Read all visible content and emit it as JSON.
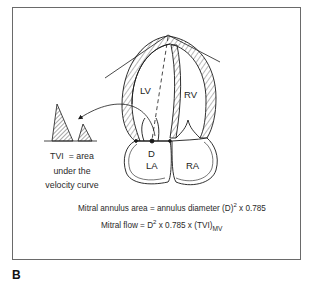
{
  "figure": {
    "panel_letter": "B",
    "chambers": {
      "lv": "LV",
      "rv": "RV",
      "la": "LA",
      "ra": "RA"
    },
    "annulus_label": "D",
    "tvi_caption": {
      "line1": "TVI  = area",
      "line2": "under the",
      "line3": "velocity curve"
    },
    "formulas": {
      "area": {
        "prefix": "Mitral annulus area = annulus diameter (D)",
        "exponent": "2",
        "suffix": " x 0.785"
      },
      "flow": {
        "prefix": "Mitral flow = D",
        "exponent": "2",
        "middle": " x 0.785 x (TVI)",
        "subscript": "MV"
      }
    },
    "icons": {
      "velocity_curve": "hatched-doppler-waveform-icon",
      "arrow": "curved-arrow-icon",
      "heart": "apical-four-chamber-heart-icon"
    },
    "colors": {
      "line": "#1a1a1a",
      "frame": "#6a6a6a",
      "background": "#ffffff"
    }
  }
}
